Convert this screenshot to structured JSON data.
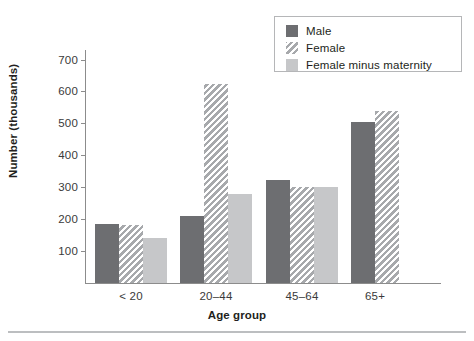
{
  "chart_data": {
    "type": "bar",
    "title": "",
    "xlabel": "Age group",
    "ylabel": "Number (thousands)",
    "categories": [
      "< 20",
      "20–44",
      "45–64",
      "65+"
    ],
    "series": [
      {
        "name": "Male",
        "values": [
          185,
          210,
          322,
          505
        ],
        "color": "#6d6e71",
        "pattern": "solid"
      },
      {
        "name": "Female",
        "values": [
          183,
          625,
          300,
          538
        ],
        "color": "#a7a9ac",
        "pattern": "diagonal-hatch"
      },
      {
        "name": "Female minus maternity",
        "values": [
          140,
          280,
          300,
          null
        ],
        "color": "#c6c7c9",
        "pattern": "solid"
      }
    ],
    "ylim": [
      0,
      730
    ],
    "yticks": [
      100,
      200,
      300,
      400,
      500,
      600,
      700
    ],
    "ytick_labels": [
      "100",
      "200",
      "300",
      "400",
      "500",
      "600",
      "700"
    ],
    "grid": false,
    "legend_position": "top-right"
  },
  "legend": {
    "entries": [
      {
        "label": "Male",
        "swatch": "male"
      },
      {
        "label": "Female",
        "swatch": "female"
      },
      {
        "label": "Female minus maternity",
        "swatch": "fmm"
      }
    ]
  }
}
